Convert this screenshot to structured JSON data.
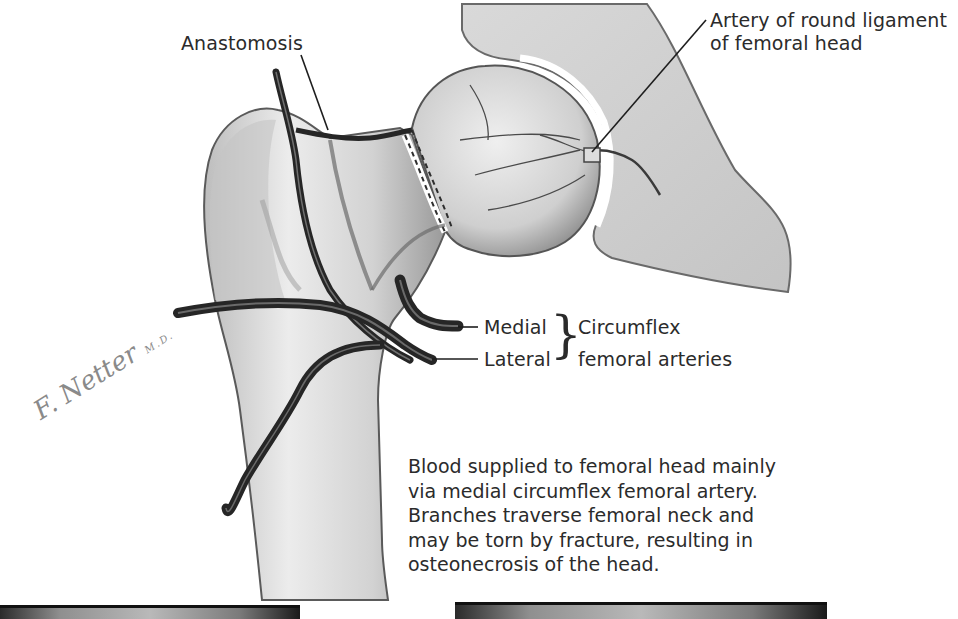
{
  "figure": {
    "type": "anatomical-illustration",
    "colors": {
      "background": "#ffffff",
      "bone_fill": "#d6d6d6",
      "bone_shadow": "#8c8c8c",
      "artery": "#2e2e2e",
      "text": "#2b2b2b",
      "signature": "#8a8a8a"
    }
  },
  "labels": {
    "anastomosis": "Anastomosis",
    "round_ligament_line1": "Artery of round ligament",
    "round_ligament_line2": "of femoral head",
    "medial": "Medial",
    "lateral": "Lateral",
    "circumflex_line1": "Circumflex",
    "circumflex_line2": "femoral arteries"
  },
  "caption": {
    "lines": [
      "Blood supplied to femoral head mainly",
      "via medial circumflex femoral artery.",
      "Branches traverse femoral neck and",
      "may be torn by fracture, resulting in",
      "osteonecrosis of the head."
    ]
  },
  "signature": {
    "name": "F. Netter",
    "suffix": "M.D."
  }
}
